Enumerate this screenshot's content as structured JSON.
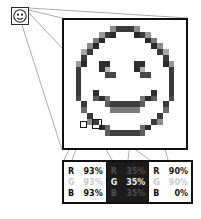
{
  "figure": {
    "source_thumbnail": {
      "name": "smiley-face-thumbnail",
      "description": "small smiley face image"
    },
    "magnified_panel": {
      "name": "magnified-pixel-grid",
      "description": "enlarged pixelated smiley face showing individual pixels",
      "columns": 21,
      "rows": 22
    },
    "markers": [
      {
        "label": "white-pixel-marker",
        "type": "filled"
      },
      {
        "label": "sampled-pixel-marker",
        "type": "outline"
      }
    ]
  },
  "rgb_table": {
    "name": "rgb-readout-table",
    "cells": [
      {
        "id": "cell-white",
        "background": "light",
        "swatch_hex": "#EDEDED",
        "channels": [
          {
            "channel": "R",
            "value": "93%",
            "emphasis": "strong"
          },
          {
            "channel": "G",
            "value": "93%",
            "emphasis": "faint"
          },
          {
            "channel": "B",
            "value": "93%",
            "emphasis": "strong"
          }
        ]
      },
      {
        "id": "cell-dark",
        "background": "dark",
        "swatch_hex": "#595959",
        "channels": [
          {
            "channel": "R",
            "value": "35%",
            "emphasis": "faint"
          },
          {
            "channel": "G",
            "value": "35%",
            "emphasis": "strong"
          },
          {
            "channel": "B",
            "value": "35%",
            "emphasis": "faint"
          }
        ]
      },
      {
        "id": "cell-yellow",
        "background": "light",
        "swatch_hex": "#E6E600",
        "channels": [
          {
            "channel": "R",
            "value": "90%",
            "emphasis": "strong"
          },
          {
            "channel": "G",
            "value": "90%",
            "emphasis": "faint"
          },
          {
            "channel": "B",
            "value": "0%",
            "emphasis": "strong"
          }
        ]
      }
    ]
  },
  "colors": {
    "ink": "#111111",
    "line": "#8a8a8a",
    "paper": "#ffffff",
    "dark_cell": "#1c1c1c"
  }
}
